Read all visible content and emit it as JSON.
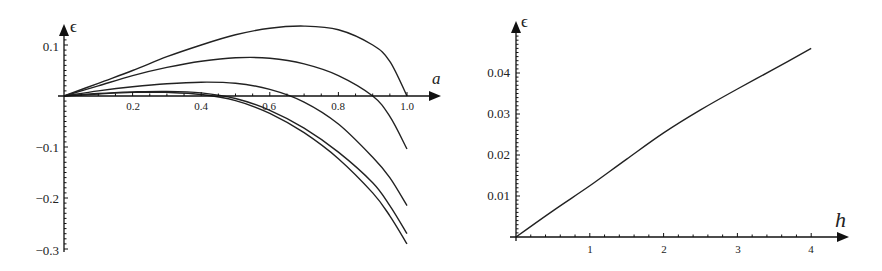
{
  "chart_data": [
    {
      "type": "line",
      "title": "",
      "xlabel": "a",
      "ylabel": "ϵ",
      "xlim": [
        0,
        1.08
      ],
      "ylim": [
        -0.3,
        0.14
      ],
      "grid": false,
      "legend": null,
      "xticks": [
        0.2,
        0.4,
        0.6,
        0.8,
        1.0
      ],
      "xtick_labels": [
        "0.2",
        "0.4",
        "0.6",
        "0.8",
        "1.0"
      ],
      "yticks": [
        0.1,
        -0.1,
        -0.2,
        -0.3
      ],
      "ytick_labels": [
        "0.1",
        "−0.1",
        "−0.2",
        "−0.3"
      ],
      "x": [
        0,
        0.1,
        0.2,
        0.3,
        0.4,
        0.5,
        0.6,
        0.7,
        0.8,
        0.9,
        0.95,
        1.0
      ],
      "series": [
        {
          "name": "curve 1",
          "values": [
            0,
            0.025,
            0.05,
            0.077,
            0.1,
            0.12,
            0.133,
            0.137,
            0.13,
            0.1,
            0.068,
            0.0
          ]
        },
        {
          "name": "curve 2",
          "values": [
            0,
            0.02,
            0.04,
            0.056,
            0.068,
            0.075,
            0.074,
            0.063,
            0.04,
            0.0,
            -0.04,
            -0.104
          ]
        },
        {
          "name": "curve 3",
          "values": [
            0,
            0.01,
            0.018,
            0.024,
            0.027,
            0.025,
            0.013,
            -0.012,
            -0.055,
            -0.12,
            -0.16,
            -0.215
          ]
        },
        {
          "name": "curve 4",
          "values": [
            0,
            0.005,
            0.008,
            0.009,
            0.006,
            -0.005,
            -0.028,
            -0.063,
            -0.11,
            -0.17,
            -0.215,
            -0.27
          ]
        },
        {
          "name": "curve 5",
          "values": [
            0,
            0.004,
            0.007,
            0.007,
            0.003,
            -0.009,
            -0.034,
            -0.072,
            -0.123,
            -0.19,
            -0.235,
            -0.29
          ]
        }
      ]
    },
    {
      "type": "line",
      "title": "",
      "xlabel": "h",
      "ylabel": "ϵ",
      "xlim": [
        0,
        4.3
      ],
      "ylim": [
        0,
        0.05
      ],
      "grid": false,
      "legend": null,
      "xticks": [
        1,
        2,
        3,
        4
      ],
      "xtick_labels": [
        "1",
        "2",
        "3",
        "4"
      ],
      "yticks": [
        0.01,
        0.02,
        0.03,
        0.04
      ],
      "ytick_labels": [
        "0.01",
        "0.02",
        "0.03",
        "0.04"
      ],
      "x": [
        0,
        0.5,
        1,
        1.5,
        2,
        2.5,
        3,
        3.5,
        4
      ],
      "series": [
        {
          "name": "epsilon(h)",
          "values": [
            0,
            0.0064,
            0.0125,
            0.019,
            0.0254,
            0.031,
            0.0361,
            0.041,
            0.046
          ]
        }
      ]
    }
  ],
  "left_chart": {
    "x_axis_label": "a",
    "y_axis_label": "ϵ",
    "xtick_labels": [
      "0.2",
      "0.4",
      "0.6",
      "0.8",
      "1.0"
    ],
    "ytick_labels": [
      "0.1",
      "−0.1",
      "−0.2",
      "−0.3"
    ]
  },
  "right_chart": {
    "x_axis_label": "h",
    "y_axis_label": "ϵ",
    "xtick_labels": [
      "1",
      "2",
      "3",
      "4"
    ],
    "ytick_labels": [
      "0.01",
      "0.02",
      "0.03",
      "0.04"
    ]
  },
  "colors": {
    "line": "#222222",
    "axis": "#111111",
    "background": "#ffffff"
  }
}
